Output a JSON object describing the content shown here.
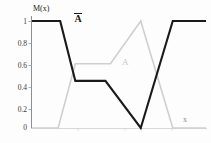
{
  "chart_data": {
    "type": "line",
    "title": "",
    "xlabel": "x",
    "ylabel": "M(x)",
    "ylim": [
      0,
      1
    ],
    "xlim": [
      0,
      1
    ],
    "grid": false,
    "legend_position": "inline-annotations",
    "ytick_labels": [
      "1",
      "0.8",
      "0.6",
      "0.4",
      "0.2",
      "0"
    ],
    "ytick_values": [
      1,
      0.8,
      0.6,
      0.4,
      0.2,
      0
    ],
    "xtick_labels": [],
    "series": [
      {
        "name": "A-complement",
        "label": "Ā",
        "color": "#1a1a1a",
        "width": 2.1,
        "x": [
          0.0,
          0.162,
          0.249,
          0.422,
          0.625,
          0.809,
          1.0
        ],
        "values": [
          1.0,
          1.0,
          0.44,
          0.44,
          0.0,
          1.0,
          1.0
        ]
      },
      {
        "name": "A",
        "label": "A",
        "color": "#cfcfcf",
        "width": 1.6,
        "x": [
          0.0,
          0.15,
          0.249,
          0.451,
          0.625,
          0.809,
          1.0
        ],
        "values": [
          0.0,
          0.0,
          0.6,
          0.6,
          1.0,
          0.0,
          0.0
        ]
      }
    ],
    "annotations": [
      {
        "name": "a-complement-label",
        "text": "Ā",
        "x": 0.28,
        "y": 0.95
      },
      {
        "name": "a-label",
        "text": "A",
        "x": 0.54,
        "y": 0.6
      },
      {
        "name": "x-axis-label",
        "text": "x",
        "x": 0.89,
        "y": 0.09
      }
    ]
  },
  "axis": {
    "y_title": "M(x)",
    "x_title": "x"
  },
  "labels": {
    "a_complement": "A",
    "a": "A",
    "x": "x"
  }
}
